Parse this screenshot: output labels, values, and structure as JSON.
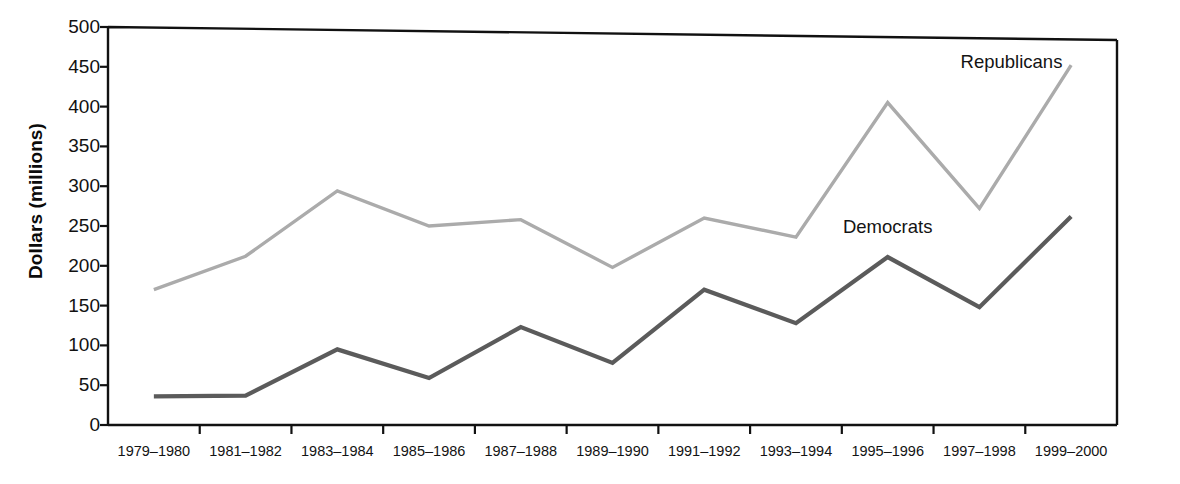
{
  "chart_data": {
    "type": "line",
    "title": "",
    "xlabel": "",
    "ylabel": "Dollars (millions)",
    "ylim": [
      0,
      500
    ],
    "yticks": [
      0,
      50,
      100,
      150,
      200,
      250,
      300,
      350,
      400,
      450,
      500
    ],
    "grid": false,
    "legend_position": "inline-annotations",
    "categories": [
      "1979–1980",
      "1981–1982",
      "1983–1984",
      "1985–1986",
      "1987–1988",
      "1989–1990",
      "1991–1992",
      "1993–1994",
      "1995–1996",
      "1997–1998",
      "1999–2000"
    ],
    "series": [
      {
        "name": "Republicans",
        "color": "#ababab",
        "values": [
          170,
          212,
          294,
          250,
          258,
          198,
          260,
          236,
          405,
          272,
          452
        ]
      },
      {
        "name": "Democrats",
        "color": "#5b5b5b",
        "values": [
          36,
          37,
          95,
          59,
          123,
          78,
          170,
          128,
          211,
          148,
          262
        ]
      }
    ],
    "annotations": [
      {
        "text": "Republicans",
        "series": "Republicans",
        "category_index": 9.35,
        "value": 455
      },
      {
        "text": "Democrats",
        "series": "Democrats",
        "category_index": 8.0,
        "value": 248
      }
    ]
  },
  "axis": {
    "y_axis_label": "Dollars (millions)",
    "y_tick_labels": [
      "500",
      "450",
      "400",
      "350",
      "300",
      "250",
      "200",
      "150",
      "100",
      "50",
      "0"
    ],
    "x_tick_labels": [
      "1979–1980",
      "1981–1982",
      "1983–1984",
      "1985–1986",
      "1987–1988",
      "1989–1990",
      "1991–1992",
      "1993–1994",
      "1995–1996",
      "1997–1998",
      "1999–2000"
    ],
    "axis_color": "#111111"
  }
}
